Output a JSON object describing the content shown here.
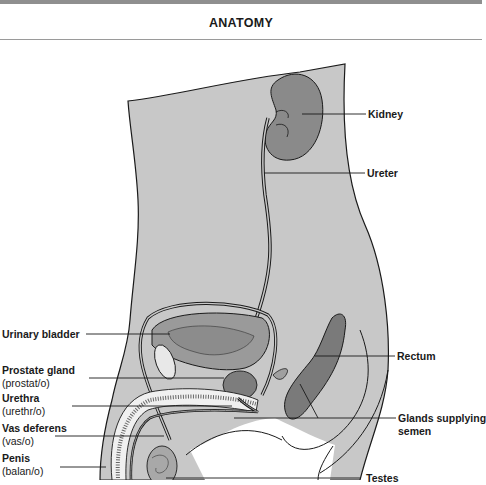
{
  "section_title": "ANATOMY",
  "figure": {
    "colors": {
      "body_fill": "#c8c8c8",
      "organ_fill": "#8a8a8a",
      "outline": "#1a1a1a",
      "top_band": "#8f8f8f"
    },
    "labels_left": [
      {
        "name": "Urinary bladder",
        "root": null
      },
      {
        "name": "Prostate gland",
        "root": "(prostat/o)"
      },
      {
        "name": "Urethra",
        "root": "(urethr/o)"
      },
      {
        "name": "Vas deferens",
        "root": "(vas/o)"
      },
      {
        "name": "Penis",
        "root": "(balan/o)"
      }
    ],
    "labels_right": [
      {
        "name": "Kidney"
      },
      {
        "name": "Ureter"
      },
      {
        "name": "Rectum"
      },
      {
        "name": "Glands supplying",
        "name2": "semen"
      },
      {
        "name": "Testes"
      }
    ]
  }
}
